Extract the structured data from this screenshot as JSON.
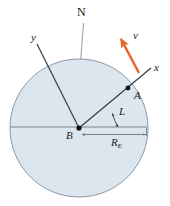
{
  "figure": {
    "type": "physics-diagram",
    "background_color": "#ffffff"
  },
  "earth": {
    "name": "earth-circle",
    "fill_color": "#dce6ef",
    "edge_color": "#8c99a6",
    "center_x": 79,
    "center_y": 128,
    "radius": 69
  },
  "labels": {
    "north": "N",
    "y_axis": "y",
    "x_axis": "x",
    "point_a": "A",
    "point_b": "B",
    "velocity": "v",
    "latitude": "L",
    "radius_main": "R",
    "radius_sub": "E"
  },
  "colors": {
    "velocity_arrow": "#e8622a",
    "axis_line": "#3a3f47",
    "equator_line": "#9aa4ae",
    "north_line": "#9aa4ae",
    "point_marker": "#111111"
  },
  "geometry": {
    "north_axis": {
      "x1": 84,
      "y1": 22,
      "x2": 80,
      "y2": 61
    },
    "x_axis": {
      "x1": 79,
      "y1": 128,
      "x2": 152,
      "y2": 67
    },
    "y_axis": {
      "x1": 37,
      "y1": 43,
      "x2": 79,
      "y2": 128
    },
    "equator": {
      "x1": 12,
      "y1": 127,
      "x2": 147,
      "y2": 127
    },
    "point_a": {
      "x": 128,
      "y": 88
    },
    "point_b": {
      "x": 79,
      "y": 128
    },
    "velocity_vector": {
      "x1": 138,
      "y1": 72,
      "x2": 120,
      "y2": 38
    },
    "latitude_arc_radius": 47,
    "radius_dimension": {
      "x1": 83,
      "y1": 134,
      "x2": 147,
      "y2": 134
    }
  }
}
